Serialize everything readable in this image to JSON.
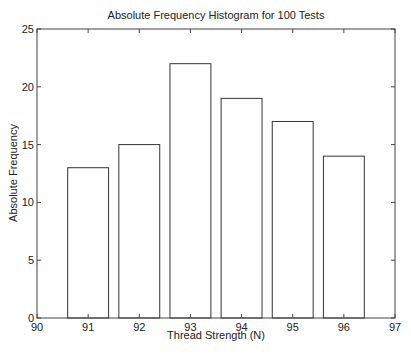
{
  "chart_data": {
    "type": "bar",
    "title": "Absolute Frequency Histogram for 100 Tests",
    "xlabel": "Thread Strength (N)",
    "ylabel": "Absolute Frequency",
    "categories": [
      "91",
      "92",
      "93",
      "94",
      "95",
      "96"
    ],
    "x": [
      91,
      92,
      93,
      94,
      95,
      96
    ],
    "values": [
      13,
      15,
      22,
      19,
      17,
      14
    ],
    "bar_width": 0.8,
    "xlim": [
      90,
      97
    ],
    "ylim": [
      0,
      25
    ],
    "xticks": [
      90,
      91,
      92,
      93,
      94,
      95,
      96,
      97
    ],
    "yticks": [
      0,
      5,
      10,
      15,
      20,
      25
    ],
    "grid": false,
    "legend": null,
    "bar_fill": "#ffffff",
    "bar_edge": "#333333"
  }
}
